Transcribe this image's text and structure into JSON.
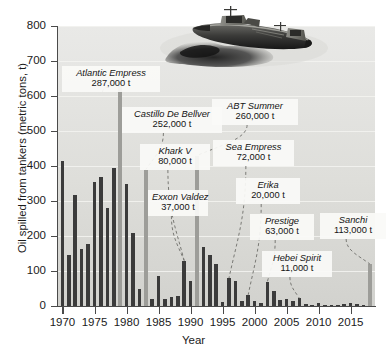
{
  "chart_data": {
    "type": "bar",
    "title": "",
    "xlabel": "Year",
    "ylabel": "Oil spilled from tankers (metric tons, t)",
    "ylim": [
      0,
      800
    ],
    "xlim": [
      1969.3,
      2018.8
    ],
    "ytick_labels": [
      "0",
      "100",
      "200",
      "300",
      "400",
      "500",
      "600",
      "700",
      "800"
    ],
    "ytick_values": [
      0,
      100,
      200,
      300,
      400,
      500,
      600,
      700,
      800
    ],
    "xtick_labels": [
      "1970",
      "1975",
      "1980",
      "1985",
      "1990",
      "1995",
      "2000",
      "2005",
      "2010",
      "2015"
    ],
    "xtick_values": [
      1970,
      1975,
      1980,
      1985,
      1990,
      1995,
      2000,
      2005,
      2010,
      2015
    ],
    "grid": true,
    "legend": "none",
    "units": "thousand tonnes",
    "series": [
      {
        "name": "Oil spilled from tankers",
        "x": [
          1970,
          1971,
          1972,
          1973,
          1974,
          1975,
          1976,
          1977,
          1978,
          1979,
          1980,
          1981,
          1982,
          1983,
          1984,
          1985,
          1986,
          1987,
          1988,
          1989,
          1990,
          1991,
          1992,
          1993,
          1994,
          1995,
          1996,
          1997,
          1998,
          1999,
          2000,
          2001,
          2002,
          2003,
          2004,
          2005,
          2006,
          2007,
          2008,
          2009,
          2010,
          2011,
          2012,
          2013,
          2014,
          2015,
          2016,
          2017,
          2018
        ],
        "values": [
          413,
          145,
          317,
          163,
          176,
          355,
          370,
          280,
          393,
          640,
          350,
          210,
          50,
          390,
          20,
          85,
          20,
          25,
          30,
          130,
          72,
          430,
          170,
          145,
          120,
          12,
          80,
          72,
          15,
          32,
          15,
          8,
          70,
          42,
          18,
          20,
          15,
          22,
          5,
          3,
          10,
          2,
          2,
          3,
          5,
          8,
          6,
          4,
          120
        ]
      }
    ],
    "highlight_years": [
      1979,
      1983,
      1991,
      2018
    ],
    "highlight_note": "grey bars mark years of the single largest named spills"
  },
  "annotations": [
    {
      "id": "atlantic-empress",
      "name": "Atlantic Empress",
      "amount": "287,000 t",
      "year": 1979,
      "box": {
        "left": 62,
        "top": 66,
        "width": 90
      }
    },
    {
      "id": "castillo-de-bellver",
      "name": "Castillo De Bellver",
      "amount": "252,000 t",
      "year": 1983,
      "box": {
        "left": 122,
        "top": 107,
        "width": 92
      }
    },
    {
      "id": "khark-v",
      "name": "Khark V",
      "amount": "80,000 t",
      "year": 1989,
      "box": {
        "left": 140,
        "top": 144,
        "width": 62
      }
    },
    {
      "id": "exxon-valdez",
      "name": "Exxon Valdez",
      "amount": "37,000 t",
      "year": 1989,
      "box": {
        "left": 148,
        "top": 190,
        "width": 52
      }
    },
    {
      "id": "abt-summer",
      "name": "ABT Summer",
      "amount": "260,000 t",
      "year": 1991,
      "box": {
        "left": 212,
        "top": 99,
        "width": 78
      }
    },
    {
      "id": "sea-empress",
      "name": "Sea Empress",
      "amount": "72,000 t",
      "year": 1996,
      "box": {
        "left": 213,
        "top": 140,
        "width": 73
      }
    },
    {
      "id": "erika",
      "name": "Erika",
      "amount": "20,000 t",
      "year": 1999,
      "box": {
        "left": 236,
        "top": 178,
        "width": 56
      }
    },
    {
      "id": "prestige",
      "name": "Prestige",
      "amount": "63,000 t",
      "year": 2002,
      "box": {
        "left": 250,
        "top": 214,
        "width": 56
      }
    },
    {
      "id": "hebei-spirit",
      "name": "Hebei Spirit",
      "amount": "11,000 t",
      "year": 2007,
      "box": {
        "left": 262,
        "top": 251,
        "width": 62
      }
    },
    {
      "id": "sanchi",
      "name": "Sanchi",
      "amount": "113,000 t",
      "year": 2018,
      "box": {
        "left": 320,
        "top": 213,
        "width": 58
      }
    }
  ],
  "artwork": {
    "ship": "oil-tanker-with-slick"
  },
  "colors": {
    "bar": "#3b3b3b",
    "bar_highlight": "#9d9d99",
    "plot_background": "#e3e3e0",
    "gridline": "#f3f3f0",
    "axis": "#4a4a4a",
    "text": "#1b1b1b",
    "callout_background": "#fafaf8"
  }
}
